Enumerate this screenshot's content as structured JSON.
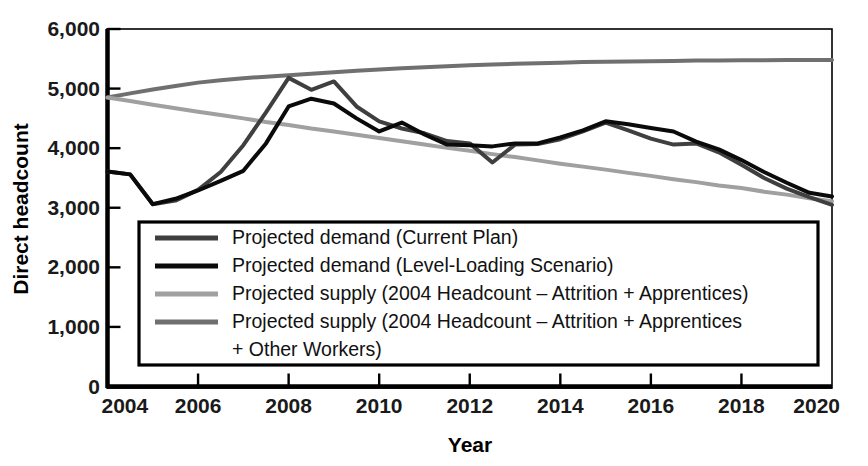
{
  "chart_data": {
    "type": "line",
    "title": "",
    "xlabel": "Year",
    "ylabel": "Direct headcount",
    "xlim": [
      2004,
      2020
    ],
    "ylim": [
      0,
      6000
    ],
    "grid": false,
    "legend_position": "inside-lower-left",
    "x_tick_labels": [
      "2004",
      "2006",
      "2008",
      "2010",
      "2012",
      "2014",
      "2016",
      "2018",
      "2020"
    ],
    "x_ticks": [
      2004,
      2006,
      2008,
      2010,
      2012,
      2014,
      2016,
      2018,
      2020
    ],
    "y_tick_labels": [
      "0",
      "1,000",
      "2,000",
      "3,000",
      "4,000",
      "5,000",
      "6,000"
    ],
    "y_ticks": [
      0,
      1000,
      2000,
      3000,
      4000,
      5000,
      6000
    ],
    "x": [
      2004,
      2004.5,
      2005,
      2005.5,
      2006,
      2006.5,
      2007,
      2007.5,
      2008,
      2008.5,
      2009,
      2009.5,
      2010,
      2010.5,
      2011,
      2011.5,
      2012,
      2012.5,
      2013,
      2013.5,
      2014,
      2014.5,
      2015,
      2015.5,
      2016,
      2016.5,
      2017,
      2017.5,
      2018,
      2018.5,
      2019,
      2019.5,
      2020
    ],
    "series": [
      {
        "name": "Projected demand (Current Plan)",
        "color": "#3f3f3f",
        "width": 4,
        "values": [
          3610,
          3560,
          3060,
          3120,
          3300,
          3600,
          4050,
          4600,
          5180,
          4980,
          5120,
          4700,
          4450,
          4330,
          4250,
          4120,
          4080,
          3760,
          4060,
          4070,
          4150,
          4280,
          4430,
          4300,
          4160,
          4060,
          4080,
          3930,
          3720,
          3500,
          3320,
          3180,
          3050
        ]
      },
      {
        "name": "Projected demand (Level-Loading Scenario)",
        "color": "#0a0a0a",
        "width": 4,
        "values": [
          3610,
          3560,
          3060,
          3150,
          3290,
          3450,
          3620,
          4080,
          4700,
          4830,
          4750,
          4500,
          4280,
          4430,
          4230,
          4060,
          4050,
          4030,
          4080,
          4080,
          4180,
          4300,
          4450,
          4400,
          4340,
          4280,
          4110,
          3980,
          3800,
          3600,
          3420,
          3250,
          3190
        ]
      },
      {
        "name": "Projected supply (2004 Headcount – Attrition + Apprentices)",
        "color": "#a0a0a0",
        "width": 4,
        "values": [
          4850,
          4790,
          4730,
          4670,
          4610,
          4555,
          4500,
          4440,
          4390,
          4330,
          4280,
          4225,
          4170,
          4115,
          4060,
          4005,
          3955,
          3900,
          3850,
          3795,
          3740,
          3690,
          3640,
          3585,
          3535,
          3480,
          3430,
          3375,
          3330,
          3270,
          3220,
          3160,
          3110
        ]
      },
      {
        "name": "Projected supply (2004 Headcount – Attrition + Apprentices + Other Workers)",
        "color": "#707070",
        "width": 4,
        "values": [
          4850,
          4920,
          4985,
          5045,
          5100,
          5140,
          5175,
          5200,
          5225,
          5250,
          5275,
          5300,
          5320,
          5340,
          5360,
          5375,
          5390,
          5405,
          5415,
          5425,
          5435,
          5445,
          5450,
          5455,
          5460,
          5465,
          5470,
          5472,
          5474,
          5476,
          5478,
          5479,
          5480
        ]
      }
    ]
  },
  "legend": {
    "items": [
      {
        "label": "Projected demand (Current Plan)",
        "color": "#3f3f3f"
      },
      {
        "label": "Projected demand (Level-Loading Scenario)",
        "color": "#0a0a0a"
      },
      {
        "label": "Projected supply (2004 Headcount – Attrition + Apprentices)",
        "color": "#a0a0a0"
      },
      {
        "label": "Projected supply (2004 Headcount – Attrition + Apprentices",
        "color": "#707070"
      },
      {
        "label": "+ Other Workers)",
        "color": null
      }
    ]
  }
}
